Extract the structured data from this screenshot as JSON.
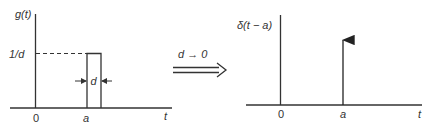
{
  "colors": {
    "ink": "#333333",
    "background": "#ffffff"
  },
  "left_plot": {
    "y_label": "g(t)",
    "level_label": "1/d",
    "width_label": "d",
    "x_ticks": [
      "0",
      "a"
    ],
    "x_label": "t"
  },
  "transition": {
    "label": "d → 0",
    "arrow": "double-arrow-right"
  },
  "right_plot": {
    "y_label": "δ(t − a)",
    "x_ticks": [
      "0",
      "a"
    ],
    "x_label": "t"
  }
}
